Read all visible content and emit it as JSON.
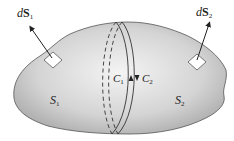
{
  "diagram": {
    "type": "surface-boundary-illustration",
    "surfaces": [
      {
        "id": "S1",
        "label_main": "S",
        "label_sub": "1"
      },
      {
        "id": "S2",
        "label_main": "S",
        "label_sub": "2"
      }
    ],
    "normals": [
      {
        "id": "dS1",
        "label_prefix": "d",
        "label_main": "S",
        "label_sub": "1"
      },
      {
        "id": "dS2",
        "label_prefix": "d",
        "label_main": "S",
        "label_sub": "2"
      }
    ],
    "curves": [
      {
        "id": "C1",
        "label_main": "C",
        "label_sub": "1",
        "direction": "up"
      },
      {
        "id": "C2",
        "label_main": "C",
        "label_sub": "2",
        "direction": "down"
      }
    ],
    "colors": {
      "surface_fill_light": "#f2f2f2",
      "surface_fill_dark": "#a8a8a8",
      "outline": "#555555",
      "curve": "#333333",
      "patch": "#ffffff",
      "arrow": "#222222"
    }
  }
}
